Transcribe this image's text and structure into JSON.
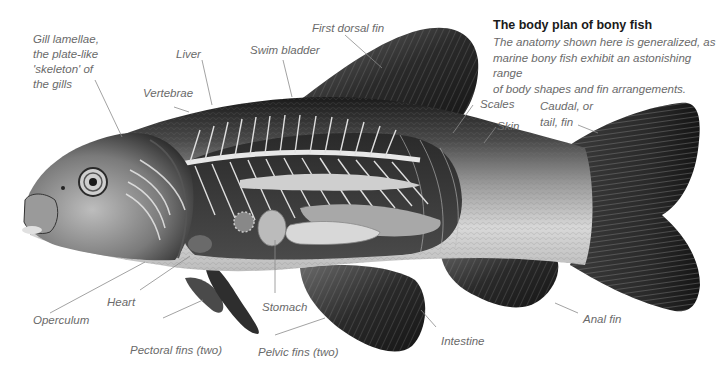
{
  "caption": {
    "title": "The body plan of bony fish",
    "lines": [
      "The anatomy shown here is generalized, as",
      "marine bony fish exhibit an astonishing range",
      "of body shapes and fin arrangements."
    ]
  },
  "labels": {
    "gill_lamellae": [
      "Gill lamellae,",
      "the plate-like",
      "'skeleton' of",
      "the gills"
    ],
    "liver": "Liver",
    "vertebrae": "Vertebrae",
    "swim_bladder": "Swim bladder",
    "first_dorsal_fin": "First dorsal fin",
    "scales": "Scales",
    "skin": "Skin",
    "caudal_fin": [
      "Caudal, or",
      "tail, fin"
    ],
    "heart": "Heart",
    "operculum": "Operculum",
    "stomach": "Stomach",
    "pectoral_fins": "Pectoral fins (two)",
    "pelvic_fins": "Pelvic fins (two)",
    "intestine": "Intestine",
    "anal_fin": "Anal fin"
  },
  "colors": {
    "label_text": "#6a6a6a",
    "title_text": "#1a1a1a",
    "leader_line": "#8a8a8a",
    "fin_dark": "#2b2b2b",
    "body_back": "#1e1e1e",
    "belly": "#e6e6e6"
  }
}
